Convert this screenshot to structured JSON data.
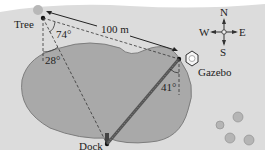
{
  "figure": {
    "points": {
      "tree": "Tree",
      "gazebo": "Gazebo",
      "dock": "Dock"
    },
    "distance_label": "100 m",
    "angles": {
      "tree_between_gazebo_and_dock": "74°",
      "tree_from_south_to_dock": "28°",
      "gazebo_from_south_to_dock": "41°"
    },
    "compass": {
      "north": "N",
      "south": "S",
      "east": "E",
      "west": "W"
    },
    "colors": {
      "land": "#dcdcdc",
      "lake": "#a9a9a9",
      "lake_edge": "#7d7d7d",
      "bridge": "#555555",
      "white_margin": "#ffffff"
    }
  }
}
